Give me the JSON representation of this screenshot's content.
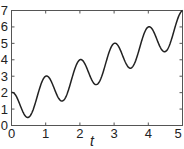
{
  "chart_data": {
    "type": "line",
    "title": "",
    "xlabel": "t",
    "ylabel": "",
    "xlim": [
      0,
      5
    ],
    "ylim": [
      0,
      7
    ],
    "xticks": [
      "0",
      "1",
      "2",
      "3",
      "4",
      "5"
    ],
    "yticks": [
      "0",
      "1",
      "2",
      "3",
      "4",
      "5",
      "6",
      "7"
    ],
    "grid": false,
    "legend": null,
    "series": [
      {
        "name": "y(t)",
        "color": "#222222",
        "x": [
          0,
          0.25,
          0.5,
          0.75,
          1,
          1.25,
          1.5,
          1.75,
          2,
          2.25,
          2.5,
          2.75,
          3,
          3.25,
          3.5,
          3.75,
          4,
          4.25,
          4.5,
          4.75,
          5
        ],
        "values": [
          2,
          1.25,
          0.5,
          1.75,
          3,
          2.25,
          1.5,
          2.75,
          4,
          3.25,
          2.5,
          3.75,
          5,
          4.25,
          3.5,
          4.75,
          6,
          5.25,
          4.5,
          5.75,
          7
        ]
      }
    ]
  },
  "axis": {
    "x_label": "t",
    "x_ticks": [
      "0",
      "1",
      "2",
      "3",
      "4",
      "5"
    ],
    "y_ticks": [
      "0",
      "1",
      "2",
      "3",
      "4",
      "5",
      "6",
      "7"
    ]
  },
  "colors": {
    "line": "#222222",
    "frame": "#555555",
    "background": "#ffffff"
  }
}
